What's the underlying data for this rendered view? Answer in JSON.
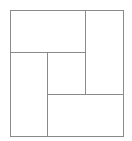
{
  "diagram": {
    "type": "rectangle-tiling",
    "stroke_color": "#8a8a8a",
    "background_color": "#ffffff",
    "stroke_width": 1,
    "outer": {
      "x": 10,
      "y": 10,
      "w": 113,
      "h": 126
    },
    "rects": [
      {
        "name": "top-left-rect",
        "x": 10,
        "y": 10,
        "w": 75,
        "h": 42
      },
      {
        "name": "right-rect",
        "x": 85,
        "y": 10,
        "w": 38,
        "h": 84
      },
      {
        "name": "left-rect",
        "x": 10,
        "y": 52,
        "w": 37,
        "h": 84
      },
      {
        "name": "center-square",
        "x": 47,
        "y": 52,
        "w": 38,
        "h": 42
      },
      {
        "name": "bottom-rect",
        "x": 47,
        "y": 94,
        "w": 76,
        "h": 42
      }
    ]
  }
}
